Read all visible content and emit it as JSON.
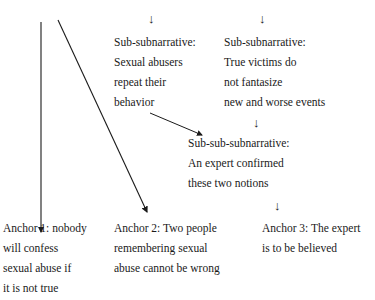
{
  "top_cut_text": "(cut off) ...and the incidence of abuse.",
  "arrows": {
    "glyph": "↓"
  },
  "sub_subnarratives": [
    {
      "label": "Sub-subnarrative:",
      "lines": [
        "Sexual abusers",
        "repeat their",
        "behavior"
      ]
    },
    {
      "label": "Sub-subnarrative:",
      "lines": [
        "True victims do",
        "not fantasize",
        "new and worse events"
      ]
    }
  ],
  "sub_sub_subnarrative": {
    "label": "Sub-sub-subnarrative:",
    "lines": [
      "An expert confirmed",
      "these two notions"
    ]
  },
  "anchors": [
    {
      "lines": [
        "Anchor 1: nobody",
        "will confess",
        "sexual abuse if",
        "it is not true"
      ]
    },
    {
      "lines": [
        "Anchor 2: Two people",
        "remembering sexual",
        "abuse cannot be wrong"
      ]
    },
    {
      "lines": [
        "Anchor 3: The expert",
        "is to be believed"
      ]
    }
  ]
}
